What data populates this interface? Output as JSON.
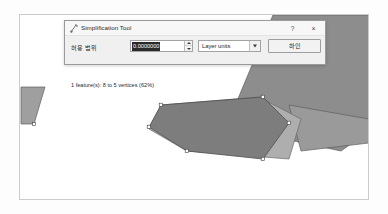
{
  "dialog": {
    "title": "Simplification Tool",
    "titlebar_icon": "simplify-tool-icon",
    "help_label": "?",
    "close_label": "×",
    "tolerance_label": "허용 범위",
    "tolerance_value": "0.0000000",
    "spin_up_icon": "triangle-up-icon",
    "spin_down_icon": "triangle-down-icon",
    "units_selected": "Layer units",
    "units_options": [
      "Layer units",
      "Map units",
      "Meters",
      "Degrees"
    ],
    "units_arrow_icon": "chevron-down-icon",
    "ok_label": "하인",
    "status": "1 feature(s): 8 to 5 vertices (62%)"
  },
  "map": {
    "canvas_name": "map-canvas",
    "background_color": "#ffffff",
    "frame_color": "#c9cbcd",
    "polygon_fill_light": "#b0b0b0",
    "polygon_fill_dark": "#8b8b8b",
    "polygon_fill_darker": "#7d7d7d",
    "polygon_stroke": "#5a5a5a",
    "vertex_color": "#ffffff",
    "vertex_stroke": "#3a3a3a",
    "shapes": [
      {
        "name": "upper-right-parcel",
        "fill": "#8d8d8d"
      },
      {
        "name": "left-edge-sliver",
        "fill": "#9f9f9f"
      },
      {
        "name": "original-polygon",
        "fill": "#a8a8a8"
      },
      {
        "name": "simplified-polygon",
        "fill": "#7e7e7e"
      },
      {
        "name": "right-small-parcel",
        "fill": "#9a9a9a"
      }
    ]
  }
}
